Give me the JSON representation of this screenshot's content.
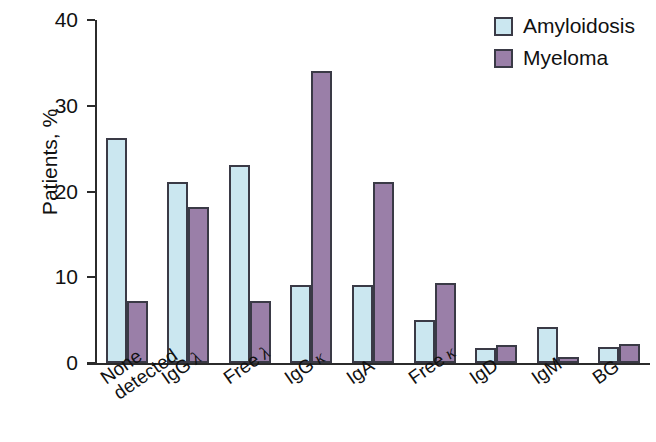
{
  "chart_data": {
    "type": "bar",
    "title": "",
    "xlabel": "",
    "ylabel": "Patients, %",
    "ylim": [
      0,
      40
    ],
    "yticks": [
      0,
      10,
      20,
      30,
      40
    ],
    "ytick_labels": [
      "0",
      "10",
      "20",
      "30",
      "40"
    ],
    "grid": false,
    "legend_position": "top-right",
    "categories": [
      "None detected",
      "IgG λ",
      "Free λ",
      "IgG κ",
      "IgA",
      "Free κ",
      "IgD",
      "IgM",
      "BG"
    ],
    "category_parts": [
      {
        "main": "None",
        "sub": "detected",
        "greek": ""
      },
      {
        "main": "IgG",
        "sub": "",
        "greek": "λ"
      },
      {
        "main": "Free",
        "sub": "",
        "greek": "λ"
      },
      {
        "main": "IgG",
        "sub": "",
        "greek": "κ"
      },
      {
        "main": "IgA",
        "sub": "",
        "greek": ""
      },
      {
        "main": "Free",
        "sub": "",
        "greek": "κ"
      },
      {
        "main": "IgD",
        "sub": "",
        "greek": ""
      },
      {
        "main": "IgM",
        "sub": "",
        "greek": ""
      },
      {
        "main": "BG",
        "sub": "",
        "greek": ""
      }
    ],
    "series": [
      {
        "name": "Amyloidosis",
        "color": "#cbe7f0",
        "values": [
          26.2,
          21.1,
          23.1,
          9.1,
          9.1,
          5.0,
          1.7,
          4.2,
          1.9
        ]
      },
      {
        "name": "Myeloma",
        "color": "#9a7fa8",
        "values": [
          7.2,
          18.2,
          7.2,
          34.1,
          21.1,
          9.3,
          2.1,
          0.7,
          2.2
        ]
      }
    ]
  },
  "legend": {
    "items": [
      {
        "label": "Amyloidosis",
        "swatch": "amyloidosis"
      },
      {
        "label": "Myeloma",
        "swatch": "myeloma"
      }
    ]
  },
  "axis": {
    "y_title": "Patients, %"
  }
}
